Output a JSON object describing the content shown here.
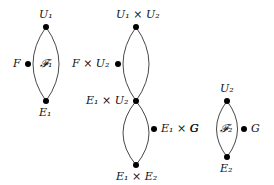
{
  "graphs": [
    {
      "name": "graph-1",
      "face_label": "𝓕₁",
      "nodes": {
        "top": "U₁",
        "left": "F",
        "bottom": "E₁"
      }
    },
    {
      "name": "graph-product",
      "nodes": {
        "top": "U₁ × U₂",
        "left": "F × U₂",
        "middle": "E₁ × U₂",
        "right": "E₁ × G",
        "bottom": "E₁ × E₂"
      }
    },
    {
      "name": "graph-2",
      "face_label": "𝓕₂",
      "nodes": {
        "top": "U₂",
        "right": "G",
        "bottom": "E₂"
      },
      "side_label": "G"
    }
  ],
  "colors": {
    "stroke": "#222222",
    "node": "#000000"
  }
}
